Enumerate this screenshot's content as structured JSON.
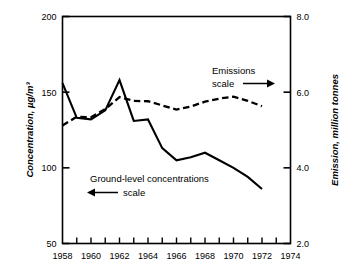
{
  "chart_data": {
    "type": "line",
    "title": "",
    "xlabel": "",
    "ylabel": "Concentration, µg/m³",
    "y2label": "Emission, million tonnes",
    "xlim": [
      1958,
      1974
    ],
    "ylim": [
      50,
      200
    ],
    "y2lim": [
      2.0,
      8.0
    ],
    "grid": false,
    "x_ticks": [
      1958,
      1959,
      1960,
      1961,
      1962,
      1963,
      1964,
      1965,
      1966,
      1967,
      1968,
      1969,
      1970,
      1971,
      1972,
      1973,
      1974
    ],
    "x_tick_labels": [
      "1958",
      "",
      "1960",
      "",
      "1962",
      "",
      "1964",
      "",
      "1966",
      "",
      "1968",
      "",
      "1970",
      "",
      "1972",
      "",
      "1974"
    ],
    "y_ticks": [
      50,
      100,
      150,
      200
    ],
    "y_tick_labels": [
      "50",
      "100",
      "150",
      "200"
    ],
    "y2_ticks": [
      2.0,
      4.0,
      6.0,
      8.0
    ],
    "y2_tick_labels": [
      "2.0",
      "4.0",
      "6.0",
      "8.0"
    ],
    "legend_position": "inline-annotations",
    "series": [
      {
        "name": "Ground-level concentrations",
        "style": "solid",
        "axis": "left",
        "unit": "µg/m³",
        "x": [
          1958,
          1959,
          1960,
          1961,
          1962,
          1963,
          1964,
          1965,
          1966,
          1967,
          1968,
          1969,
          1970,
          1971,
          1972
        ],
        "values": [
          156,
          133,
          132,
          138,
          158,
          131,
          132,
          113,
          105,
          107,
          110,
          105,
          100,
          94,
          86
        ]
      },
      {
        "name": "Emissions",
        "style": "dashed",
        "axis": "right",
        "unit": "million tonnes",
        "x": [
          1958,
          1959,
          1960,
          1961,
          1962,
          1963,
          1964,
          1965,
          1966,
          1967,
          1968,
          1969,
          1970,
          1971,
          1972
        ],
        "values": [
          5.12,
          5.35,
          5.34,
          5.55,
          5.87,
          5.77,
          5.76,
          5.65,
          5.54,
          5.62,
          5.75,
          5.83,
          5.88,
          5.77,
          5.63
        ]
      }
    ],
    "annotations": [
      {
        "id": "emissions-annotation",
        "line1": "Emissions",
        "line2": "scale",
        "arrow": "right",
        "arrow_glyph": "→"
      },
      {
        "id": "concentrations-annotation",
        "line1": "Ground-level concentrations",
        "line2": "scale",
        "arrow": "left",
        "arrow_glyph": "←"
      }
    ],
    "colors": {
      "axis": "#000000",
      "series_solid": "#000000",
      "series_dashed": "#000000",
      "background": "#ffffff"
    }
  }
}
